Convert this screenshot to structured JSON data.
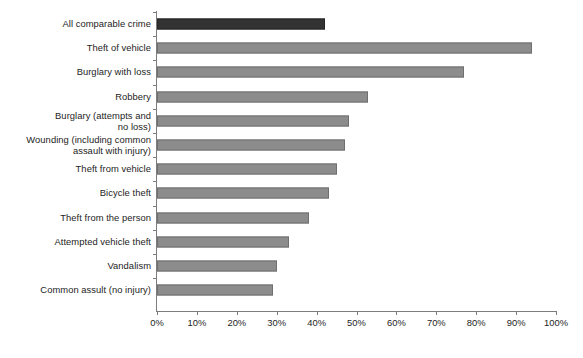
{
  "chart_data": {
    "type": "bar",
    "orientation": "horizontal",
    "title": "",
    "subtitle": "",
    "xlabel": "",
    "ylabel": "",
    "xlim": [
      0,
      100
    ],
    "grid": false,
    "legend": null,
    "tick_suffix": "%",
    "categories": [
      "All comparable crime",
      "Theft of vehicle",
      "Burglary with loss",
      "Robbery",
      "Burglary (attempts and no loss)",
      "Wounding (including common assault with injury)",
      "Theft from vehicle",
      "Bicycle theft",
      "Theft from the person",
      "Attempted vehicle theft",
      "Vandalism",
      "Common assult (no injury)"
    ],
    "category_lines": [
      [
        "All comparable crime"
      ],
      [
        "Theft of vehicle"
      ],
      [
        "Burglary with loss"
      ],
      [
        "Robbery"
      ],
      [
        "Burglary (attempts and",
        "no loss)"
      ],
      [
        "Wounding (including common",
        "assault with injury)"
      ],
      [
        "Theft from vehicle"
      ],
      [
        "Bicycle theft"
      ],
      [
        "Theft from the person"
      ],
      [
        "Attempted vehicle theft"
      ],
      [
        "Vandalism"
      ],
      [
        "Common assult (no injury)"
      ]
    ],
    "values": [
      42,
      94,
      77,
      53,
      48,
      47,
      45,
      43,
      38,
      33,
      30,
      29
    ],
    "highlight_index": 0,
    "colors": {
      "bar": "#8c8c8c",
      "bar_edge": "#6f6f6f",
      "highlight_bar": "#333333",
      "highlight_bar_edge": "#242424",
      "axis": "#7d7d7d",
      "text": "#1d1d1d",
      "background": "#ffffff"
    },
    "xticks": [
      0,
      10,
      20,
      30,
      40,
      50,
      60,
      70,
      80,
      90,
      100
    ],
    "xtick_labels": [
      "0%",
      "10%",
      "20%",
      "30%",
      "40%",
      "50%",
      "60%",
      "70%",
      "80%",
      "90%",
      "100%"
    ]
  }
}
